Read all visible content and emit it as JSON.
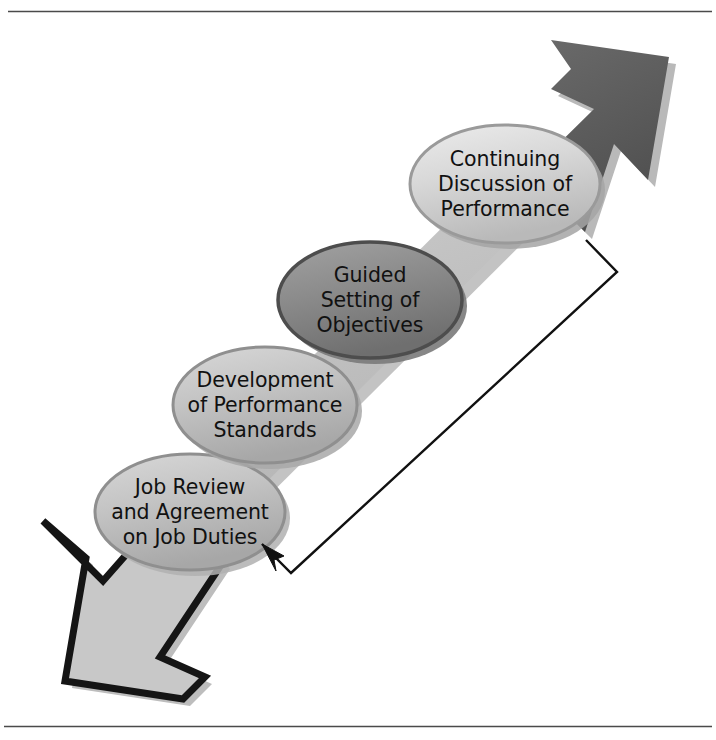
{
  "page": {
    "background_color": "#ffffff",
    "width": 716,
    "height": 740,
    "top_rule": true,
    "bottom_rule": true
  },
  "diagram": {
    "type": "cycle-flow-diagram",
    "orientation": "diagonal-ascending",
    "band": {
      "name": "diagonal-arrow-band",
      "fill_light": "#c6c6c6",
      "fill_dark": "#6e6e6e",
      "outline": "#1a1a1a"
    },
    "stages": [
      {
        "id": "stage-continuing-discussion",
        "index": 1,
        "lines": [
          "Continuing",
          "Discussion of",
          "Performance"
        ],
        "fill": "#dcdcdc",
        "stroke": "#9a9a9a",
        "cx": 505,
        "cy": 184,
        "rx": 95,
        "ry": 59
      },
      {
        "id": "stage-guided-setting",
        "index": 2,
        "lines": [
          "Guided",
          "Setting of",
          "Objectives"
        ],
        "fill": "#8e8e8e",
        "stroke": "#4d4d4d",
        "cx": 370,
        "cy": 300,
        "rx": 92,
        "ry": 58
      },
      {
        "id": "stage-development-standards",
        "index": 3,
        "lines": [
          "Development",
          "of Performance",
          "Standards"
        ],
        "fill": "#c9c9c9",
        "stroke": "#8f8f8f",
        "cx": 265,
        "cy": 405,
        "rx": 92,
        "ry": 58
      },
      {
        "id": "stage-job-review",
        "index": 4,
        "lines": [
          "Job Review",
          "and Agreement",
          "on Job Duties"
        ],
        "fill": "#c2c2c2",
        "stroke": "#8f8f8f",
        "cx": 190,
        "cy": 512,
        "rx": 95,
        "ry": 58
      }
    ],
    "arrowheads": [
      {
        "id": "arrowhead-top-right",
        "direction": "up-right",
        "fill": "#5e5e5e",
        "shadow": "#b9b9b9"
      },
      {
        "id": "arrowhead-bottom-left",
        "direction": "down-left",
        "fill": "#c8c8c8",
        "stroke": "#151515",
        "shadow": "#bdbdbd"
      }
    ],
    "feedback_loop": {
      "id": "feedback-loop-arrow",
      "stroke": "#111111",
      "stroke_width": 2.4,
      "from": "stage-continuing-discussion",
      "to": "stage-job-review",
      "path_points": [
        [
          586,
          240
        ],
        [
          617,
          272
        ],
        [
          291,
          573
        ],
        [
          262,
          544
        ]
      ]
    }
  }
}
